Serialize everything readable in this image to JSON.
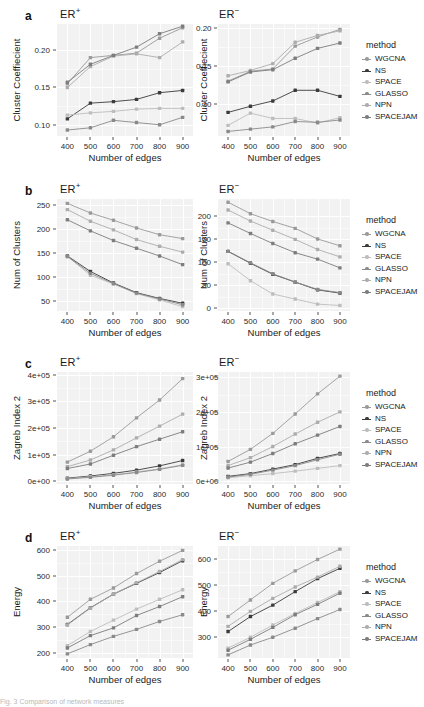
{
  "figure": {
    "x_label": "Number of edges",
    "x_categories": [
      400,
      500,
      600,
      700,
      800,
      900
    ],
    "legend_title": "method",
    "methods": [
      {
        "name": "WGCNA",
        "color": "#9a9a9a"
      },
      {
        "name": "NS",
        "color": "#3b3b3b"
      },
      {
        "name": "SPACE",
        "color": "#bdbdbd"
      },
      {
        "name": "GLASSO",
        "color": "#8a8a8a"
      },
      {
        "name": "NPN",
        "color": "#adadad"
      },
      {
        "name": "SPACEJAM",
        "color": "#7d7d7d"
      }
    ],
    "caption_partial": "Fig. 3  Comparison of network measures"
  },
  "panels": [
    {
      "letter": "a",
      "y_label": "Cluster Coeffiecient",
      "left": {
        "title_base": "ER",
        "title_sup": "+",
        "y_ticks": [
          0.1,
          0.15,
          0.2
        ],
        "y_tick_labels": [
          "0.10",
          "0.15",
          "0.20"
        ],
        "ylim": [
          0.085,
          0.235
        ]
      },
      "right": {
        "title_base": "ER",
        "title_sup": "−",
        "y_ticks": [
          0.1,
          0.15,
          0.2
        ],
        "y_tick_labels": [
          "0.10",
          "0.15",
          "0.20"
        ],
        "ylim": [
          0.058,
          0.205
        ]
      },
      "chart_data": {
        "type": "line",
        "title": "Cluster Coefficient vs Number of edges",
        "xlabel": "Number of edges",
        "ylabel": "Cluster Coeffiecient",
        "x": [
          400,
          500,
          600,
          700,
          800,
          900
        ],
        "subplots": [
          {
            "name": "ER+",
            "ylim": [
              0.085,
              0.235
            ],
            "series": [
              {
                "name": "WGCNA",
                "values": [
                  0.155,
                  0.19,
                  0.193,
                  0.196,
                  0.216,
                  0.23
                ]
              },
              {
                "name": "NS",
                "values": [
                  0.108,
                  0.129,
                  0.131,
                  0.134,
                  0.143,
                  0.146
                ]
              },
              {
                "name": "SPACE",
                "values": [
                  0.113,
                  0.116,
                  0.118,
                  0.121,
                  0.122,
                  0.122
                ]
              },
              {
                "name": "GLASSO",
                "values": [
                  0.093,
                  0.096,
                  0.106,
                  0.103,
                  0.1,
                  0.11
                ]
              },
              {
                "name": "NPN",
                "values": [
                  0.15,
                  0.178,
                  0.192,
                  0.195,
                  0.19,
                  0.211
                ]
              },
              {
                "name": "SPACEJAM",
                "values": [
                  0.157,
                  0.181,
                  0.193,
                  0.204,
                  0.222,
                  0.232
                ]
              }
            ]
          },
          {
            "name": "ER-",
            "ylim": [
              0.058,
              0.205
            ],
            "series": [
              {
                "name": "WGCNA",
                "values": [
                  0.13,
                  0.143,
                  0.146,
                  0.176,
                  0.188,
                  0.198
                ]
              },
              {
                "name": "NS",
                "values": [
                  0.089,
                  0.097,
                  0.104,
                  0.118,
                  0.118,
                  0.11
                ]
              },
              {
                "name": "SPACE",
                "values": [
                  0.072,
                  0.088,
                  0.081,
                  0.081,
                  0.075,
                  0.082
                ]
              },
              {
                "name": "GLASSO",
                "values": [
                  0.064,
                  0.067,
                  0.07,
                  0.077,
                  0.076,
                  0.079
                ]
              },
              {
                "name": "NPN",
                "values": [
                  0.137,
                  0.144,
                  0.153,
                  0.181,
                  0.19,
                  0.196
                ]
              },
              {
                "name": "SPACEJAM",
                "values": [
                  0.129,
                  0.142,
                  0.145,
                  0.16,
                  0.173,
                  0.18
                ]
              }
            ]
          }
        ]
      }
    },
    {
      "letter": "b",
      "y_label": "Num of Clusters",
      "left": {
        "title_base": "ER",
        "title_sup": "+",
        "y_ticks": [
          50,
          100,
          150,
          200,
          250
        ],
        "y_tick_labels": [
          "50",
          "100",
          "150",
          "200",
          "250"
        ],
        "ylim": [
          30,
          262
        ]
      },
      "right": {
        "title_base": "ER",
        "title_sup": "−",
        "y_ticks": [
          0,
          50,
          100,
          150,
          200
        ],
        "y_tick_labels": [
          "0",
          "50",
          "100",
          "150",
          "200"
        ],
        "ylim": [
          -6,
          238
        ]
      },
      "chart_data": {
        "type": "line",
        "title": "Num of Clusters vs Number of edges",
        "xlabel": "Number of edges",
        "ylabel": "Num of Clusters",
        "x": [
          400,
          500,
          600,
          700,
          800,
          900
        ],
        "subplots": [
          {
            "name": "ER+",
            "ylim": [
              30,
              262
            ],
            "series": [
              {
                "name": "WGCNA",
                "values": [
                  253,
                  233,
                  218,
                  202,
                  188,
                  180
                ]
              },
              {
                "name": "NS",
                "values": [
                  144,
                  112,
                  88,
                  68,
                  56,
                  46
                ]
              },
              {
                "name": "SPACE",
                "values": [
                  143,
                  104,
                  86,
                  66,
                  53,
                  39
                ]
              },
              {
                "name": "GLASSO",
                "values": [
                  143,
                  108,
                  87,
                  67,
                  55,
                  43
                ]
              },
              {
                "name": "NPN",
                "values": [
                  240,
                  216,
                  198,
                  178,
                  164,
                  152
                ]
              },
              {
                "name": "SPACEJAM",
                "values": [
                  219,
                  196,
                  176,
                  160,
                  144,
                  126
                ]
              }
            ]
          },
          {
            "name": "ER-",
            "ylim": [
              -6,
              238
            ],
            "series": [
              {
                "name": "WGCNA",
                "values": [
                  231,
                  206,
                  189,
                  174,
                  151,
                  136
                ]
              },
              {
                "name": "NS",
                "values": [
                  124,
                  98,
                  74,
                  57,
                  40,
                  33
                ]
              },
              {
                "name": "SPACE",
                "values": [
                  97,
                  60,
                  31,
                  20,
                  9,
                  6
                ]
              },
              {
                "name": "GLASSO",
                "values": [
                  124,
                  99,
                  75,
                  57,
                  41,
                  34
                ]
              },
              {
                "name": "NPN",
                "values": [
                  214,
                  190,
                  170,
                  150,
                  128,
                  112
                ]
              },
              {
                "name": "SPACEJAM",
                "values": [
                  186,
                  163,
                  141,
                  121,
                  107,
                  88
                ]
              }
            ]
          }
        ]
      }
    },
    {
      "letter": "c",
      "y_label": "Zagreb Index 2",
      "left": {
        "title_base": "ER",
        "title_sup": "+",
        "y_ticks": [
          0,
          100000,
          200000,
          300000,
          400000
        ],
        "y_tick_labels": [
          "0e+00",
          "1e+05",
          "2e+05",
          "3e+05",
          "4e+05"
        ],
        "ylim": [
          -10000,
          410000
        ]
      },
      "right": {
        "title_base": "ER",
        "title_sup": "−",
        "y_ticks": [
          0,
          100000,
          200000,
          300000
        ],
        "y_tick_labels": [
          "0e+00",
          "1e+05",
          "2e+05",
          "3e+05"
        ],
        "ylim": [
          -8000,
          315000
        ]
      },
      "chart_data": {
        "type": "line",
        "title": "Zagreb Index 2 vs Number of edges",
        "xlabel": "Number of edges",
        "ylabel": "Zagreb Index 2",
        "x": [
          400,
          500,
          600,
          700,
          800,
          900
        ],
        "subplots": [
          {
            "name": "ER+",
            "ylim": [
              -10000,
              410000
            ],
            "series": [
              {
                "name": "WGCNA",
                "values": [
                  72000,
                  113000,
                  167000,
                  238000,
                  305000,
                  385000
                ]
              },
              {
                "name": "NS",
                "values": [
                  12000,
                  20000,
                  30000,
                  42000,
                  58000,
                  78000
                ]
              },
              {
                "name": "SPACE",
                "values": [
                  10000,
                  17000,
                  25000,
                  35000,
                  47000,
                  62000
                ]
              },
              {
                "name": "GLASSO",
                "values": [
                  9000,
                  15000,
                  23000,
                  33000,
                  45000,
                  60000
                ]
              },
              {
                "name": "NPN",
                "values": [
                  55000,
                  80000,
                  118000,
                  163000,
                  207000,
                  252000
                ]
              },
              {
                "name": "SPACEJAM",
                "values": [
                  48000,
                  65000,
                  98000,
                  130000,
                  158000,
                  186000
                ]
              }
            ]
          },
          {
            "name": "ER-",
            "ylim": [
              -8000,
              315000
            ],
            "series": [
              {
                "name": "WGCNA",
                "values": [
                  57000,
                  92000,
                  138000,
                  194000,
                  252000,
                  303000
                ]
              },
              {
                "name": "NS",
                "values": [
                  14000,
                  22000,
                  35000,
                  48000,
                  66000,
                  80000
                ]
              },
              {
                "name": "SPACE",
                "values": [
                  10000,
                  16000,
                  22000,
                  29000,
                  37000,
                  45000
                ]
              },
              {
                "name": "GLASSO",
                "values": [
                  12000,
                  20000,
                  32000,
                  45000,
                  62000,
                  78000
                ]
              },
              {
                "name": "NPN",
                "values": [
                  45000,
                  68000,
                  100000,
                  136000,
                  170000,
                  200000
                ]
              },
              {
                "name": "SPACEJAM",
                "values": [
                  38000,
                  55000,
                  80000,
                  108000,
                  133000,
                  158000
                ]
              }
            ]
          }
        ]
      }
    },
    {
      "letter": "d",
      "y_label": "Energy",
      "left": {
        "title_base": "ER",
        "title_sup": "+",
        "y_ticks": [
          200,
          300,
          400,
          500,
          600
        ],
        "y_tick_labels": [
          "200",
          "300",
          "400",
          "500",
          "600"
        ],
        "ylim": [
          180,
          615
        ]
      },
      "right": {
        "title_base": "ER",
        "title_sup": "−",
        "y_ticks": [
          300,
          400,
          500,
          600
        ],
        "y_tick_labels": [
          "300",
          "400",
          "500",
          "600"
        ],
        "ylim": [
          218,
          650
        ]
      },
      "chart_data": {
        "type": "line",
        "title": "Energy vs Number of edges",
        "xlabel": "Number of edges",
        "ylabel": "Energy",
        "x": [
          400,
          500,
          600,
          700,
          800,
          900
        ],
        "subplots": [
          {
            "name": "ER+",
            "ylim": [
              180,
              615
            ],
            "series": [
              {
                "name": "WGCNA",
                "values": [
                  338,
                  408,
                  452,
                  508,
                  556,
                  598
                ]
              },
              {
                "name": "NS",
                "values": [
                  310,
                  375,
                  428,
                  470,
                  512,
                  558
                ]
              },
              {
                "name": "SPACE",
                "values": [
                  228,
                  283,
                  327,
                  370,
                  408,
                  445
                ]
              },
              {
                "name": "GLASSO",
                "values": [
                  196,
                  232,
                  264,
                  291,
                  322,
                  348
                ]
              },
              {
                "name": "NPN",
                "values": [
                  308,
                  374,
                  428,
                  472,
                  516,
                  562
                ]
              },
              {
                "name": "SPACEJAM",
                "values": [
                  219,
                  267,
                  297,
                  345,
                  380,
                  418
                ]
              }
            ]
          },
          {
            "name": "ER-",
            "ylim": [
              218,
              650
            ],
            "series": [
              {
                "name": "WGCNA",
                "values": [
                  378,
                  442,
                  506,
                  554,
                  598,
                  638
                ]
              },
              {
                "name": "NS",
                "values": [
                  320,
                  378,
                  422,
                  474,
                  524,
                  564
                ]
              },
              {
                "name": "SPACE",
                "values": [
                  256,
                  298,
                  345,
                  390,
                  432,
                  474
                ]
              },
              {
                "name": "GLASSO",
                "values": [
                  230,
                  268,
                  298,
                  333,
                  370,
                  405
                ]
              },
              {
                "name": "NPN",
                "values": [
                  340,
                  398,
                  448,
                  492,
                  530,
                  572
                ]
              },
              {
                "name": "SPACEJAM",
                "values": [
                  248,
                  290,
                  336,
                  385,
                  425,
                  468
                ]
              }
            ]
          }
        ]
      }
    }
  ]
}
